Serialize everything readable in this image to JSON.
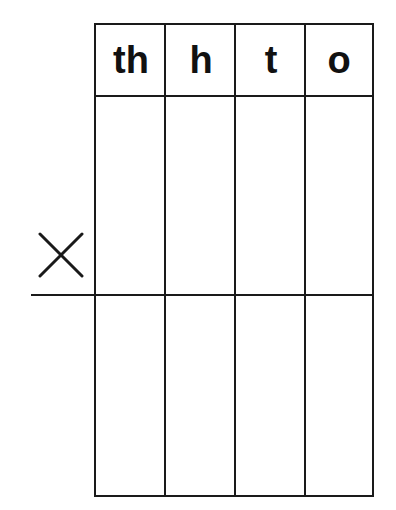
{
  "worksheet": {
    "title": "Place value multiplication grid",
    "columns": [
      {
        "label": "th",
        "meaning": "thousands"
      },
      {
        "label": "h",
        "meaning": "hundreds"
      },
      {
        "label": "t",
        "meaning": "tens"
      },
      {
        "label": "o",
        "meaning": "ones"
      }
    ],
    "operator_icon": "multiplication-sign-icon",
    "colors": {
      "line": "#1a1a1a",
      "text": "#111111",
      "background": "#ffffff"
    }
  }
}
